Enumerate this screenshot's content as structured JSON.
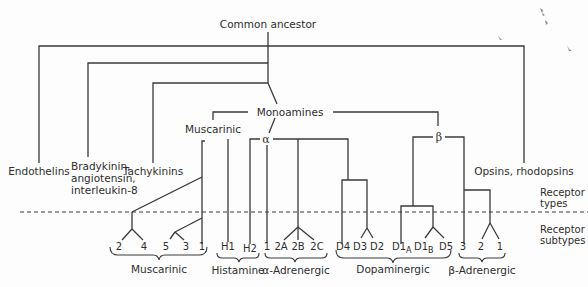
{
  "diagram": {
    "root": "Common ancestor",
    "families": {
      "endothelins": "Endothelins",
      "bradykinin_line1": "Bradykinin,",
      "bradykinin_line2": "angiotensin,",
      "bradykinin_line3": "interleukin-8",
      "tachykinins": "Tachykinins",
      "monoamines": "Monoamines",
      "muscarinic_type": "Muscarinic",
      "alpha": "α",
      "beta": "β",
      "opsins": "Opsins, rhodopsins"
    },
    "side_labels": {
      "types_line1": "Receptor",
      "types_line2": "types",
      "subtypes_line1": "Receptor",
      "subtypes_line2": "subtypes"
    },
    "subtypes": {
      "muscarinic": [
        "2",
        "4",
        "5",
        "3",
        "1"
      ],
      "histamine": [
        "H1",
        "H2"
      ],
      "alpha_adrenergic": [
        "1",
        "2A",
        "2B",
        "2C"
      ],
      "dopaminergic": {
        "d4": "D4",
        "d3": "D3",
        "d2": "D2",
        "d1a_base": "D1",
        "d1a_sub": "A",
        "d1b_base": "D1",
        "d1b_sub": "B",
        "d5": "D5"
      },
      "beta_adrenergic": [
        "3",
        "2",
        "1"
      ]
    },
    "groups": {
      "muscarinic": "Muscarinic",
      "histamine": "Histamine",
      "alpha_adrenergic": "α-Adrenergic",
      "dopaminergic": "Dopaminergic",
      "beta_adrenergic": "β-Adrenergic"
    }
  }
}
